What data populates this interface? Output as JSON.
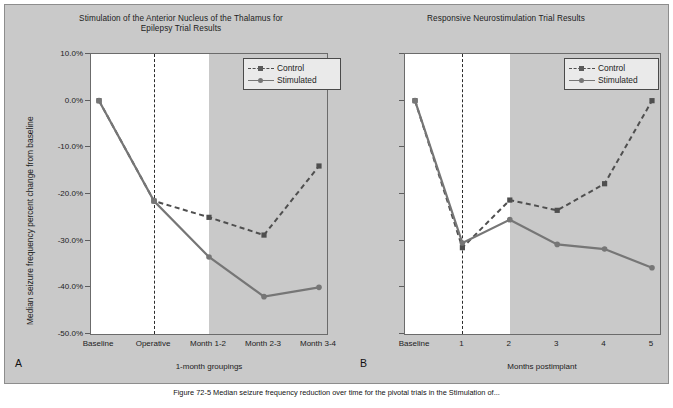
{
  "figure": {
    "caption_prefix": "Figure 72-5",
    "caption_text": "Median seizure frequency reduction over time for the pivotal trials in the Stimulation of..."
  },
  "colors": {
    "control": "#4f4f4f",
    "stimulated": "#767676",
    "plot_background": "#ffffff",
    "band_shade": "#c9c9c9",
    "figure_background": "#c9c9c9",
    "axis": "#6b6b6b",
    "text": "#1c1c1c"
  },
  "legend": {
    "position": "top-right",
    "entries": [
      {
        "label": "Control",
        "style": "dashed",
        "marker": "square"
      },
      {
        "label": "Stimulated",
        "style": "solid",
        "marker": "circle"
      }
    ]
  },
  "panels": [
    {
      "letter": "A"
    },
    {
      "letter": "B"
    }
  ],
  "chart_data": [
    {
      "type": "line",
      "panel": "A",
      "title": "Stimulation of the Anterior Nucleus of the Thalamus for Epilepsy Trial Results",
      "title_line1": "Stimulation of the Anterior Nucleus of the Thalamus for",
      "title_line2": "Epilepsy Trial Results",
      "xlabel": "1-month groupings",
      "ylabel": "Median seizure frequency percent change from baseline",
      "categories": [
        "Baseline",
        "Operative",
        "Month 1-2",
        "Month 2-3",
        "Month 3-4"
      ],
      "ylim": [
        -50,
        10
      ],
      "yticks": [
        10,
        0,
        -10,
        -20,
        -30,
        -40,
        -50
      ],
      "ytick_labels": [
        "10.0%",
        "0.0%",
        "-10.0%",
        "-20.0%",
        "-30.0%",
        "-40.0%",
        "-50.0%"
      ],
      "grid": false,
      "annotations": {
        "vertical_dashed_line_at": "Operative",
        "shaded_region_from": "Month 1-2",
        "shaded_region_to": "Month 3-4"
      },
      "series": [
        {
          "name": "Control",
          "style": "dashed",
          "marker": "square",
          "values": [
            0.0,
            -21.5,
            -25.0,
            -28.8,
            -14.0
          ]
        },
        {
          "name": "Stimulated",
          "style": "solid",
          "marker": "circle",
          "values": [
            0.0,
            -21.5,
            -33.5,
            -42.0,
            -40.0
          ]
        }
      ]
    },
    {
      "type": "line",
      "panel": "B",
      "title": "Responsive Neurostimulation Trial Results",
      "title_line1": "Responsive Neurostimulation Trial Results",
      "title_line2": "",
      "xlabel": "Months postimplant",
      "ylabel": "",
      "categories": [
        "Baseline",
        "1",
        "2",
        "3",
        "4",
        "5"
      ],
      "ylim": [
        -50,
        10
      ],
      "yticks": [
        10,
        0,
        -10,
        -20,
        -30,
        -40,
        -50
      ],
      "ytick_labels": [
        "",
        "",
        "",
        "",
        "",
        "",
        ""
      ],
      "grid": false,
      "annotations": {
        "vertical_dashed_line_at": "1",
        "shaded_region_from": "2",
        "shaded_region_to": "5"
      },
      "series": [
        {
          "name": "Control",
          "style": "dashed",
          "marker": "square",
          "values": [
            0.0,
            -31.5,
            -21.3,
            -23.5,
            -17.8,
            0.0
          ]
        },
        {
          "name": "Stimulated",
          "style": "solid",
          "marker": "circle",
          "values": [
            0.0,
            -30.5,
            -25.5,
            -30.8,
            -31.8,
            -35.8
          ]
        }
      ]
    }
  ]
}
